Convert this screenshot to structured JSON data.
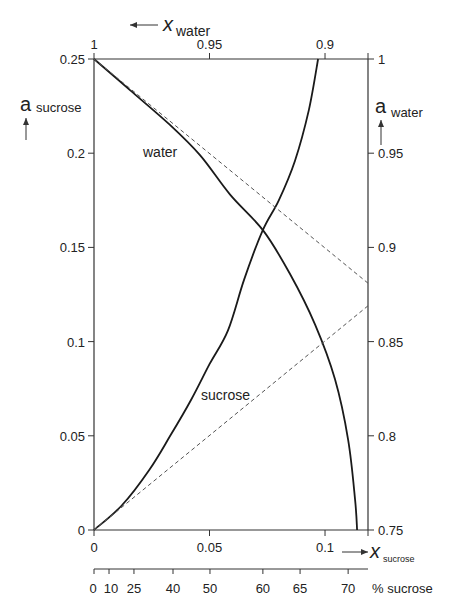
{
  "chart_data": {
    "type": "line",
    "title": "",
    "axes": {
      "bottom": {
        "label": "x sucrose",
        "label_main": "x",
        "label_sub": "sucrose",
        "range": [
          0,
          0.1186
        ],
        "ticks": [
          0,
          0.05,
          0.1
        ],
        "tick_labels": [
          "0",
          "0.05",
          "0.1"
        ]
      },
      "top": {
        "label": "x water",
        "label_main": "x",
        "label_sub": "water",
        "direction": "reversed",
        "range": [
          1,
          0.8814
        ],
        "ticks": [
          1,
          0.95,
          0.9
        ],
        "tick_labels": [
          "1",
          "0.95",
          "0.9"
        ]
      },
      "left": {
        "label": "a sucrose",
        "label_main": "a",
        "label_sub": "sucrose",
        "range": [
          0,
          0.25
        ],
        "ticks": [
          0,
          0.05,
          0.1,
          0.15,
          0.2,
          0.25
        ],
        "tick_labels": [
          "0",
          "0.05",
          "0.1",
          "0.15",
          "0.2",
          "0.25"
        ]
      },
      "right": {
        "label": "a water",
        "label_main": "a",
        "label_sub": "water",
        "range": [
          0.75,
          1
        ],
        "ticks": [
          0.75,
          0.8,
          0.85,
          0.9,
          0.95,
          1
        ],
        "tick_labels": [
          "0.75",
          "0.8",
          "0.85",
          "0.9",
          "0.95",
          "1"
        ]
      },
      "percent": {
        "label": "% sucrose",
        "ticks": [
          0,
          10,
          25,
          40,
          50,
          60,
          65,
          70
        ],
        "tick_labels": [
          "0",
          "10",
          "25",
          "40",
          "50",
          "60",
          "65",
          "70"
        ],
        "tick_positions_x_sucrose": [
          0,
          0.0065,
          0.0173,
          0.0342,
          0.0502,
          0.0731,
          0.0892,
          0.11
        ]
      }
    },
    "series": [
      {
        "name": "sucrose",
        "axis": "left",
        "style": "solid",
        "x": [
          0,
          0.012,
          0.024,
          0.033,
          0.042,
          0.05,
          0.058,
          0.065,
          0.073,
          0.08,
          0.087,
          0.093,
          0.097
        ],
        "y": [
          0,
          0.013,
          0.032,
          0.05,
          0.069,
          0.088,
          0.106,
          0.133,
          0.159,
          0.175,
          0.196,
          0.223,
          0.25
        ]
      },
      {
        "name": "water",
        "axis": "right",
        "style": "solid",
        "x": [
          0,
          0.0156,
          0.0329,
          0.0459,
          0.0589,
          0.0732,
          0.0848,
          0.0957,
          0.1043,
          0.11,
          0.113,
          0.1139
        ],
        "y": [
          1.0,
          0.9835,
          0.965,
          0.949,
          0.928,
          0.909,
          0.886,
          0.859,
          0.83,
          0.798,
          0.766,
          0.75
        ]
      },
      {
        "name": "sucrose ideal (Raoult)",
        "axis": "left",
        "style": "dashed",
        "x": [
          0,
          0.1186
        ],
        "y": [
          0,
          0.119
        ]
      },
      {
        "name": "water ideal (Raoult)",
        "axis": "right",
        "style": "dashed",
        "x": [
          0,
          0.1186
        ],
        "y": [
          1.0,
          0.881
        ]
      }
    ],
    "annotations": [
      {
        "text": "water",
        "near_series": "water"
      },
      {
        "text": "sucrose",
        "near_series": "sucrose"
      }
    ],
    "grid": false,
    "legend": "none"
  },
  "labels": {
    "water_curve": "water",
    "sucrose_curve": "sucrose",
    "x_main": "x",
    "a_main": "a",
    "sub_water": "water",
    "sub_sucrose": "sucrose",
    "percent_label": "% sucrose"
  },
  "colors": {
    "line": "#1a1a1a",
    "axis": "#333333",
    "dashed": "#555555"
  }
}
